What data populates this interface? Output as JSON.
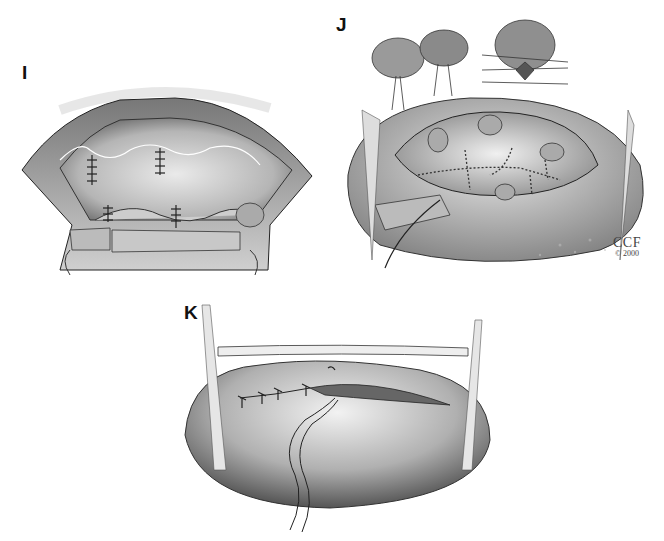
{
  "figure": {
    "panels": [
      {
        "id": "I",
        "label": "I",
        "description": "Opened valve view with plicated leaflets and vertical suture lines"
      },
      {
        "id": "J",
        "label": "J",
        "description": "Chordal/papillary repair insets and opened atrium with continuous suture lines"
      },
      {
        "id": "K",
        "label": "K",
        "description": "Closure of atriotomy with interrupted sutures and retraction bands"
      }
    ],
    "credit": {
      "line1": "CCF",
      "line2": "© 2000"
    }
  },
  "colors": {
    "ink": "#111111",
    "tissue_dark": "#5a5a5a",
    "tissue_mid": "#9a9a9a",
    "tissue_light": "#d8d8d8",
    "background": "#ffffff"
  }
}
